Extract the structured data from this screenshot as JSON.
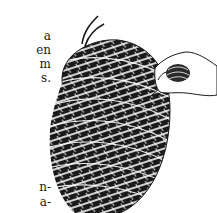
{
  "page": {
    "text_fragments_top": [
      "a",
      "en",
      "m",
      "s."
    ],
    "text_fragments_bottom": [
      "n-",
      "a-"
    ]
  },
  "illustration": {
    "subject": "wound-cord-ball-with-hand",
    "ink_color": "#1a1a1a",
    "paper_color": "#ffffff"
  }
}
